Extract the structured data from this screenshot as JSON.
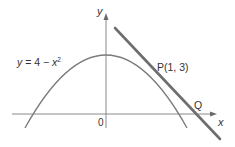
{
  "diagram": {
    "curve_label": {
      "prefix": "y",
      "mid": " = 4 − ",
      "var": "x",
      "exp": "2"
    },
    "point_p_label": "P(1, 3)",
    "point_q_label": "Q",
    "origin_label": "0",
    "x_axis_label": "x",
    "y_axis_label": "y",
    "colors": {
      "axes": "#8a8a8a",
      "curve": "#7a7a7a",
      "tangent": "#6e6e6e",
      "text": "#333333"
    }
  }
}
